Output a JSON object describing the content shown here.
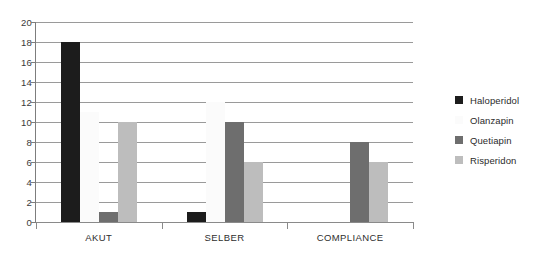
{
  "chart_data": {
    "type": "bar",
    "title": "",
    "subtitle": "",
    "xlabel": "",
    "ylabel": "",
    "ylim": [
      0,
      20
    ],
    "ytick_step": 2,
    "yticks": [
      20,
      18,
      16,
      14,
      12,
      10,
      8,
      6,
      4,
      2,
      0
    ],
    "categories": [
      "AKUT",
      "SELBER",
      "COMPLIANCE"
    ],
    "series": [
      {
        "name": "Haloperidol",
        "color": "#1c1c1c",
        "values": [
          18,
          1,
          0
        ]
      },
      {
        "name": "Olanzapin",
        "color": "#fbfbfb",
        "values": [
          11,
          12,
          0
        ]
      },
      {
        "name": "Quetiapin",
        "color": "#6e6e6e",
        "values": [
          1,
          10,
          8
        ]
      },
      {
        "name": "Risperidon",
        "color": "#bdbdbd",
        "values": [
          10,
          6,
          6
        ]
      }
    ],
    "grid": true,
    "grid_axis": "y",
    "legend_position": "right",
    "annotations": []
  },
  "legend": {
    "items": [
      {
        "label": "Haloperidol"
      },
      {
        "label": "Olanzapin"
      },
      {
        "label": "Quetiapin"
      },
      {
        "label": "Risperidon"
      }
    ]
  }
}
